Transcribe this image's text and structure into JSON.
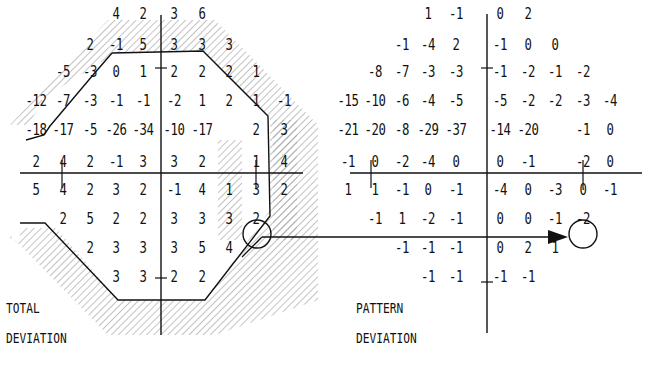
{
  "total_deviation": {
    "label_line1": "TOTAL",
    "label_line2": "DEVIATION",
    "rows": [
      [
        "",
        "",
        "",
        "4",
        "2",
        "3",
        "6",
        "",
        "",
        ""
      ],
      [
        "",
        "",
        "2",
        "-1",
        "5",
        "3",
        "3",
        "3",
        "",
        ""
      ],
      [
        "",
        "-5",
        "-3",
        "0",
        "1",
        "2",
        "2",
        "2",
        "1",
        ""
      ],
      [
        "-12",
        "-7",
        "-3",
        "-1",
        "-1",
        "-2",
        "1",
        "2",
        "1",
        "-1"
      ],
      [
        "-18",
        "-17",
        "-5",
        "-26",
        "-34",
        "-10",
        "-17",
        "",
        "2",
        "3"
      ],
      [
        "2",
        "4",
        "2",
        "-1",
        "3",
        "3",
        "2",
        "",
        "1",
        "4"
      ],
      [
        "5",
        "4",
        "2",
        "3",
        "2",
        "-1",
        "4",
        "1",
        "3",
        "2"
      ],
      [
        "",
        "2",
        "5",
        "2",
        "2",
        "3",
        "3",
        "3",
        "2",
        ""
      ],
      [
        "",
        "",
        "2",
        "3",
        "3",
        "3",
        "5",
        "4",
        "",
        ""
      ],
      [
        "",
        "",
        "",
        "3",
        "3",
        "2",
        "2",
        "",
        "",
        ""
      ]
    ],
    "circled_cell": {
      "row": 6,
      "col": 8,
      "value": "3"
    }
  },
  "pattern_deviation": {
    "label_line1": "PATTERN",
    "label_line2": "DEVIATION",
    "rows": [
      [
        "",
        "",
        "",
        "1",
        "-1",
        "0",
        "2",
        "",
        "",
        ""
      ],
      [
        "",
        "",
        "-1",
        "-4",
        "2",
        "-1",
        "0",
        "0",
        "",
        ""
      ],
      [
        "",
        "-8",
        "-7",
        "-3",
        "-3",
        "-1",
        "-2",
        "-1",
        "-2",
        ""
      ],
      [
        "-15",
        "-10",
        "-6",
        "-4",
        "-5",
        "-5",
        "-2",
        "-2",
        "-3",
        "-4"
      ],
      [
        "-21",
        "-20",
        "-8",
        "-29",
        "-37",
        "-14",
        "-20",
        "",
        "-1",
        "0"
      ],
      [
        "-1",
        "0",
        "-2",
        "-4",
        "0",
        "0",
        "-1",
        "",
        "-2",
        "0"
      ],
      [
        "1",
        "1",
        "-1",
        "0",
        "-1",
        "-4",
        "0",
        "-3",
        "0",
        "-1"
      ],
      [
        "",
        "-1",
        "1",
        "-2",
        "-1",
        "0",
        "0",
        "-1",
        "-2",
        ""
      ],
      [
        "",
        "",
        "-1",
        "-1",
        "-1",
        "0",
        "2",
        "1",
        "",
        ""
      ],
      [
        "",
        "",
        "",
        "-1",
        "-1",
        "-1",
        "-1",
        "",
        "",
        ""
      ]
    ],
    "circled_cell": {
      "row": 6,
      "col": 8,
      "value": "0"
    }
  },
  "colors": {
    "ink": "#111111",
    "hatch": "#9a9a9a",
    "background": "#ffffff"
  }
}
